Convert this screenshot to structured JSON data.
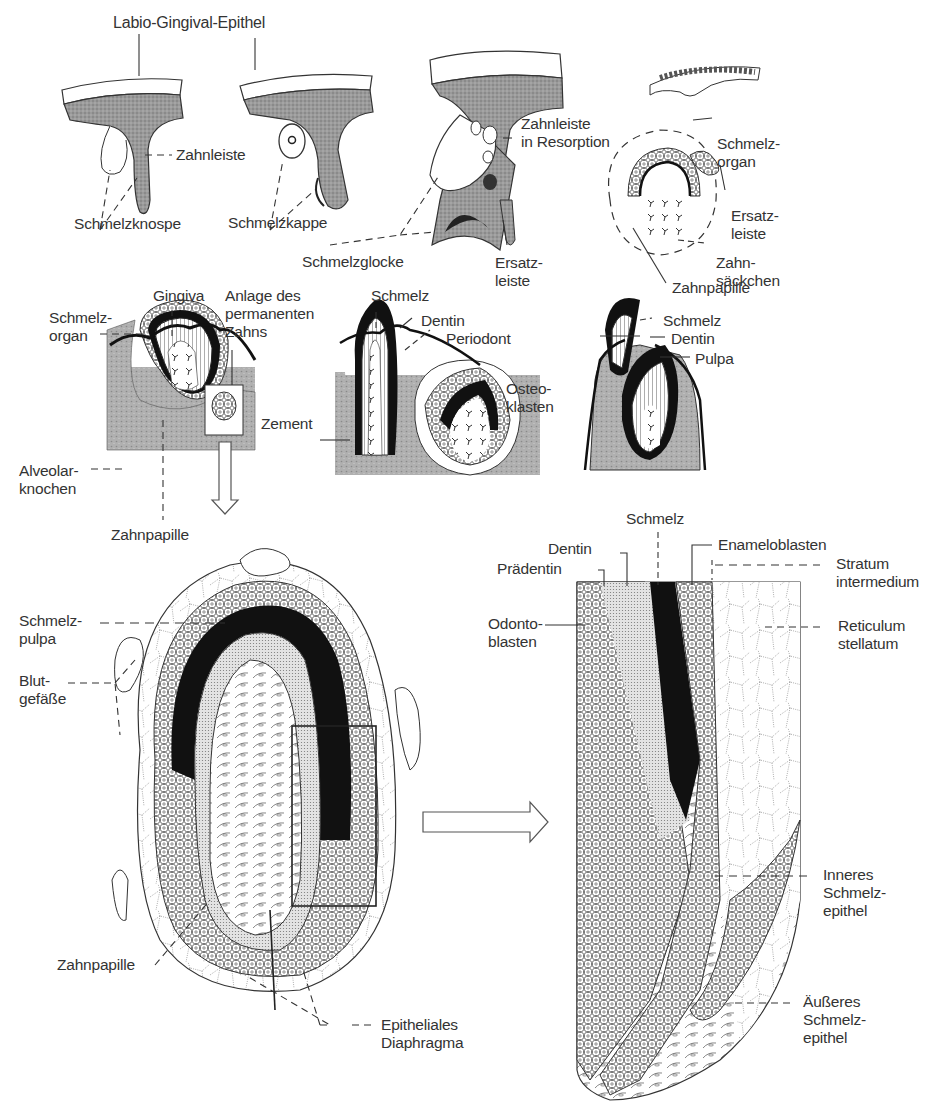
{
  "figure": {
    "topic": "Zahnentwicklung (tooth development)",
    "header_partial": "), (Zahnentwicklung ...)",
    "colors": {
      "tissue_gray": "#8f8f8f",
      "enamel_black": "#111111",
      "bone_gray": "#a9a9a9",
      "line": "#2a2a2a",
      "background": "#ffffff"
    },
    "panels": [
      {
        "id": "stage-bud",
        "labels": {
          "epithelium": "Labio-Gingival-Epithel",
          "dental_lamina": "Zahnleiste",
          "bud": "Schmelzknospe"
        }
      },
      {
        "id": "stage-cap",
        "labels": {
          "cap": "Schmelzkappe"
        }
      },
      {
        "id": "stage-bell",
        "labels": {
          "lamina_resorption": "Zahnleiste\nin Resorption",
          "bell": "Schmelzglocke",
          "successional_lamina": "Ersatz-\nleiste"
        }
      },
      {
        "id": "stage-bell-section",
        "labels": {
          "enamel_organ": "Schmelz-\norgan",
          "successional_lamina": "Ersatz-\nleiste",
          "dental_follicle": "Zahn-\nsäckchen",
          "dental_papilla": "Zahnpapille"
        }
      },
      {
        "id": "stage-crown",
        "labels": {
          "enamel_organ": "Schmelz-\norgan",
          "gingiva": "Gingiva",
          "permanent_germ": "Anlage des\npermanenten\nZahns",
          "alveolar_bone": "Alveolar-\nknochen",
          "dental_papilla": "Zahnpapille"
        }
      },
      {
        "id": "stage-eruption",
        "labels": {
          "enamel": "Schmelz",
          "dentin": "Dentin",
          "periodontium": "Periodont",
          "cementum": "Zement"
        }
      },
      {
        "id": "stage-replacement",
        "labels": {
          "papilla": "Zahnpapille",
          "enamel": "Schmelz",
          "dentin": "Dentin",
          "pulp": "Pulpa",
          "osteoclasts": "Osteo-\nklasten"
        }
      },
      {
        "id": "histology-overview",
        "labels": {
          "enamel_pulp": "Schmelz-\npulpa",
          "blood_vessels": "Blut-\ngefäße",
          "dental_papilla": "Zahnpapille",
          "epithelial_diaphragm": "Epitheliales\nDiaphragma"
        }
      },
      {
        "id": "histology-detail",
        "labels": {
          "enamel": "Schmelz",
          "dentin": "Dentin",
          "predentin": "Prädentin",
          "ameloblasts": "Enameloblasten",
          "stratum_intermedium": "Stratum\nintermedium",
          "odontoblasts": "Odonto-\nblasten",
          "stellate_reticulum": "Reticulum\nstellatum",
          "inner_enamel_epithelium": "Inneres\nSchmelz-\nepithel",
          "outer_enamel_epithelium": "Äußeres\nSchmelz-\nepithel"
        }
      }
    ],
    "arrows": [
      {
        "id": "arrow-down",
        "direction": "down"
      },
      {
        "id": "arrow-right",
        "direction": "right"
      }
    ]
  }
}
